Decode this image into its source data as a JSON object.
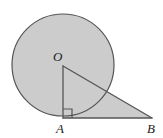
{
  "figure": {
    "name": "circle-tangent-right-triangle-diagram",
    "width": 163,
    "height": 138,
    "background_color": "#ffffff",
    "fill_color": "#cccccc",
    "stroke_color": "#555555",
    "label_color": "#1a1a1a",
    "stroke_width": 1.2
  },
  "labels": {
    "center": "O",
    "tangent_point": "A",
    "outer_point": "B"
  },
  "geometry": {
    "circle": {
      "center_x": 63,
      "center_y": 65,
      "radius": 51,
      "label": "O"
    },
    "points": {
      "O": {
        "x": 63,
        "y": 66
      },
      "A": {
        "x": 63,
        "y": 118
      },
      "B": {
        "x": 152,
        "y": 118
      }
    },
    "segments": [
      {
        "name": "radius-OA",
        "from": "O",
        "to": "A"
      },
      {
        "name": "hypotenuse-OB",
        "from": "O",
        "to": "B"
      },
      {
        "name": "leg-AB",
        "from": "A",
        "to": "B"
      }
    ],
    "right_angle": {
      "at": "A",
      "marker_size": 9,
      "opens": "right-up"
    }
  }
}
